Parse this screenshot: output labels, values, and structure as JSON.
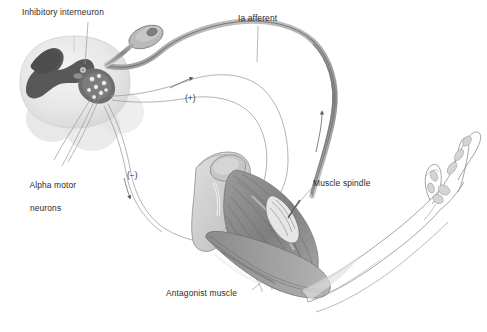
{
  "figure": {
    "background_color": "#ffffff",
    "width": 487,
    "height": 332
  },
  "labels": {
    "inhibitory_interneuron": "Inhibitory interneuron",
    "ia_afferent": "Ia afferent",
    "alpha_motor_neurons_line1": "Alpha motor",
    "alpha_motor_neurons_line2": "neurons",
    "muscle_spindle": "Muscle spindle",
    "antagonist_muscle": "Antagonist muscle"
  },
  "signs": {
    "excitatory": "(+)",
    "inhibitory": "(−)"
  },
  "colors": {
    "text": "#2a2a2a",
    "leader_line": "#8d8d8d",
    "gray_matter": "#5a5a5a",
    "white_matter": "#e8e8e8",
    "nerve": "#9a9a9a",
    "nerve_dark": "#6f6f6f",
    "muscle": "#8c8c8c",
    "bone": "#d0d0d0",
    "outline": "#7a7a7a"
  },
  "structures": {
    "spinal_cord": "spinal-cord-cross-section",
    "dorsal_root_ganglion": "dorsal-root-ganglion",
    "arm": "flexed-arm-with-muscles",
    "hand": "hand-skeleton-outline",
    "spindle": "muscle-spindle-organ"
  }
}
